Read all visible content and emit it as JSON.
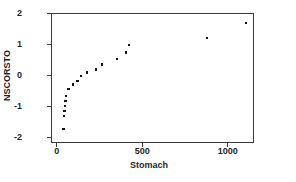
{
  "figure": {
    "background": "#ffffff",
    "frame_color": "#3b3b3b",
    "text_color": "#1f1f1f"
  },
  "chart_data": {
    "type": "scatter",
    "title": "",
    "xlabel": "Stomach",
    "ylabel": "NSCORSTO",
    "xlim": [
      -33,
      1153
    ],
    "ylim": [
      -2.18,
      2.02
    ],
    "x_ticks": [
      0,
      500,
      1000
    ],
    "y_ticks": [
      2,
      1,
      0,
      -1,
      -2
    ],
    "grid": false,
    "legend": null,
    "marker": "small-black-square",
    "marker_color": "#141414",
    "points": [
      {
        "x": 39,
        "y": -1.73
      },
      {
        "x": 44,
        "y": -1.31
      },
      {
        "x": 46,
        "y": -1.15
      },
      {
        "x": 48,
        "y": -0.99
      },
      {
        "x": 52,
        "y": -0.82
      },
      {
        "x": 56,
        "y": -0.66
      },
      {
        "x": 70,
        "y": -0.44
      },
      {
        "x": 97,
        "y": -0.29
      },
      {
        "x": 122,
        "y": -0.17
      },
      {
        "x": 144,
        "y": -0.02
      },
      {
        "x": 177,
        "y": 0.1
      },
      {
        "x": 231,
        "y": 0.2
      },
      {
        "x": 265,
        "y": 0.36
      },
      {
        "x": 351,
        "y": 0.54
      },
      {
        "x": 404,
        "y": 0.75
      },
      {
        "x": 421,
        "y": 0.98
      },
      {
        "x": 877,
        "y": 1.22
      },
      {
        "x": 1105,
        "y": 1.69
      }
    ]
  }
}
